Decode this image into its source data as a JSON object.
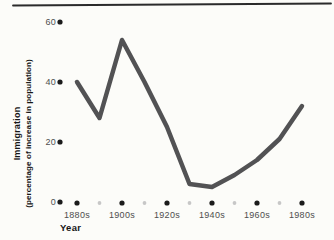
{
  "figure": {
    "xlabel": "Year",
    "ylabel_line1": "Immigration",
    "ylabel_line2": "(percentage of increase in population)"
  },
  "chart_data": {
    "type": "line",
    "title": "",
    "xlabel": "Year",
    "ylabel": "Immigration (percentage of increase in population)",
    "categories": [
      "1880s",
      "1890s",
      "1900s",
      "1910s",
      "1920s",
      "1930s",
      "1940s",
      "1950s",
      "1960s",
      "1970s",
      "1980s"
    ],
    "values": [
      40,
      28,
      54,
      40,
      25,
      6,
      5,
      9,
      14,
      21,
      32
    ],
    "x_labeled_ticks": [
      "1880s",
      "1900s",
      "1920s",
      "1940s",
      "1960s",
      "1980s"
    ],
    "y_ticks": [
      0,
      20,
      40,
      60
    ],
    "ylim": [
      0,
      65
    ],
    "grid": false,
    "legend": "none",
    "tick_style": "dots",
    "line_color": "#525254",
    "major_dot_color": "#1b1b1b",
    "minor_dot_color": "#c7c7c7"
  }
}
